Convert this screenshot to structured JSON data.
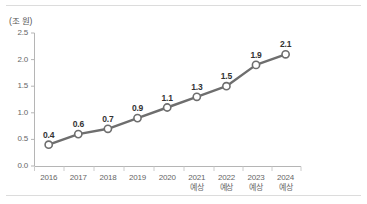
{
  "chart_data": {
    "type": "line",
    "title": "",
    "subtitle": "",
    "xlabel": "",
    "ylabel": "(조 원)",
    "unit_note": "(조 원)",
    "categories": [
      "2016",
      "2017",
      "2018",
      "2019",
      "2020",
      "2021",
      "2022",
      "2023",
      "2024"
    ],
    "category_sublabels": [
      "",
      "",
      "",
      "",
      "",
      "예상",
      "예상",
      "예상",
      "예상"
    ],
    "values": [
      0.4,
      0.6,
      0.7,
      0.9,
      1.1,
      1.3,
      1.5,
      1.9,
      2.1
    ],
    "point_labels": [
      "0.4",
      "0.6",
      "0.7",
      "0.9",
      "1.1",
      "1.3",
      "1.5",
      "1.9",
      "2.1"
    ],
    "ylim": [
      0.0,
      2.5
    ],
    "yticks": [
      0.0,
      0.5,
      1.0,
      1.5,
      2.0,
      2.5
    ],
    "ytick_labels": [
      "0.0",
      "0.5",
      "1.0",
      "1.5",
      "2.0",
      "2.5"
    ],
    "grid": false,
    "legend": false,
    "legend_position": "none",
    "series_color": "#6e6e6e",
    "marker_fill": "#ffffff",
    "marker_stroke": "#6e6e6e",
    "axis_color": "#b5b5b5",
    "text_color": "#666666",
    "label_color": "#333333",
    "background": "#ffffff"
  }
}
